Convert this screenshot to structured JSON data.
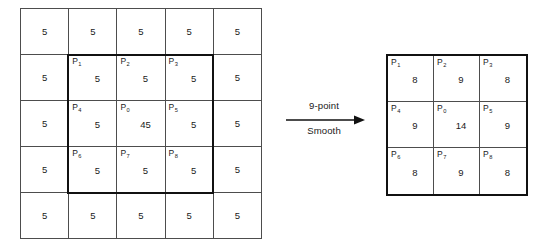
{
  "diagram": {
    "title_text": "",
    "arrow": {
      "label_top": "9-point",
      "label_bottom": "Smooth",
      "direction": "right",
      "color": "#111111"
    },
    "colors": {
      "ink": "#1a1a1a",
      "thin_rule": "#4d4d4d",
      "bold_rule": "#111111",
      "background": "#ffffff"
    },
    "left_grid": {
      "name": "input-image-grid",
      "rows": 5,
      "cols": 5,
      "cells": [
        [
          {
            "label": "",
            "sub": "",
            "value": "5"
          },
          {
            "label": "",
            "sub": "",
            "value": "5"
          },
          {
            "label": "",
            "sub": "",
            "value": "5"
          },
          {
            "label": "",
            "sub": "",
            "value": "5"
          },
          {
            "label": "",
            "sub": "",
            "value": "5"
          }
        ],
        [
          {
            "label": "",
            "sub": "",
            "value": "5"
          },
          {
            "label": "P",
            "sub": "1",
            "value": "5"
          },
          {
            "label": "P",
            "sub": "2",
            "value": "5"
          },
          {
            "label": "P",
            "sub": "3",
            "value": "5"
          },
          {
            "label": "",
            "sub": "",
            "value": "5"
          }
        ],
        [
          {
            "label": "",
            "sub": "",
            "value": "5"
          },
          {
            "label": "P",
            "sub": "4",
            "value": "5"
          },
          {
            "label": "P",
            "sub": "0",
            "value": "45"
          },
          {
            "label": "P",
            "sub": "5",
            "value": "5"
          },
          {
            "label": "",
            "sub": "",
            "value": "5"
          }
        ],
        [
          {
            "label": "",
            "sub": "",
            "value": "5"
          },
          {
            "label": "P",
            "sub": "6",
            "value": "5"
          },
          {
            "label": "P",
            "sub": "7",
            "value": "5"
          },
          {
            "label": "P",
            "sub": "8",
            "value": "5"
          },
          {
            "label": "",
            "sub": "",
            "value": "5"
          }
        ],
        [
          {
            "label": "",
            "sub": "",
            "value": "5"
          },
          {
            "label": "",
            "sub": "",
            "value": "5"
          },
          {
            "label": "",
            "sub": "",
            "value": "5"
          },
          {
            "label": "",
            "sub": "",
            "value": "5"
          },
          {
            "label": "",
            "sub": "",
            "value": "5"
          }
        ]
      ]
    },
    "right_grid": {
      "name": "output-image-grid",
      "rows": 3,
      "cols": 3,
      "cells": [
        [
          {
            "label": "P",
            "sub": "1",
            "value": "8"
          },
          {
            "label": "P",
            "sub": "2",
            "value": "9"
          },
          {
            "label": "P",
            "sub": "3",
            "value": "8"
          }
        ],
        [
          {
            "label": "P",
            "sub": "4",
            "value": "9"
          },
          {
            "label": "P",
            "sub": "0",
            "value": "14"
          },
          {
            "label": "P",
            "sub": "5",
            "value": "9"
          }
        ],
        [
          {
            "label": "P",
            "sub": "6",
            "value": "8"
          },
          {
            "label": "P",
            "sub": "7",
            "value": "9"
          },
          {
            "label": "P",
            "sub": "8",
            "value": "8"
          }
        ]
      ]
    }
  }
}
